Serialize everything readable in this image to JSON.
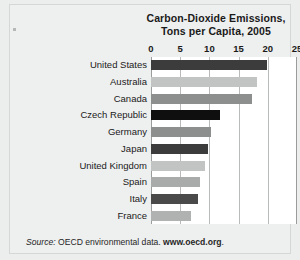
{
  "chart_data": {
    "type": "bar",
    "orientation": "horizontal",
    "title": "Carbon-Dioxide Emissions, Tons per Capita, 2005",
    "title_lines": [
      "Carbon-Dioxide Emissions,",
      "Tons per Capita, 2005"
    ],
    "xlabel": "",
    "ylabel": "",
    "xlim": [
      0,
      25
    ],
    "xticks": [
      0,
      5,
      10,
      15,
      20,
      25
    ],
    "xtick_labels": [
      "0",
      "5",
      "10",
      "15",
      "20",
      "25"
    ],
    "grid": true,
    "legend": false,
    "categories": [
      "United States",
      "Australia",
      "Canada",
      "Czech Republic",
      "Germany",
      "Japan",
      "United Kingdom",
      "Spain",
      "Italy",
      "France"
    ],
    "values": [
      19.9,
      18.2,
      17.3,
      11.9,
      10.2,
      9.8,
      9.2,
      8.4,
      8.1,
      6.8
    ],
    "bar_colors": [
      "#3c3c3c",
      "#c2c3c3",
      "#8d8e8e",
      "#0f0f0f",
      "#8d8e8e",
      "#3c3c3c",
      "#c2c3c3",
      "#a9aaaa",
      "#4a4a4a",
      "#b0b1b1"
    ]
  },
  "source": {
    "lead": "Source:",
    "text": " OECD environmental data.",
    "url": " www.oecd.org",
    "tail": "."
  }
}
